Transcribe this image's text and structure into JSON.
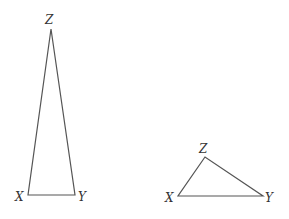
{
  "figure": {
    "triangles": [
      {
        "id": "tall",
        "vertices": {
          "X": {
            "label": "X",
            "x": 28,
            "y": 195
          },
          "Y": {
            "label": "Y",
            "x": 75,
            "y": 195
          },
          "Z": {
            "label": "Z",
            "x": 51,
            "y": 29
          }
        }
      },
      {
        "id": "wide",
        "vertices": {
          "X": {
            "label": "X",
            "x": 178,
            "y": 196
          },
          "Y": {
            "label": "Y",
            "x": 263,
            "y": 196
          },
          "Z": {
            "label": "Z",
            "x": 205,
            "y": 157
          }
        }
      }
    ],
    "colors": {
      "stroke": "#555555",
      "label": "#333333"
    }
  }
}
